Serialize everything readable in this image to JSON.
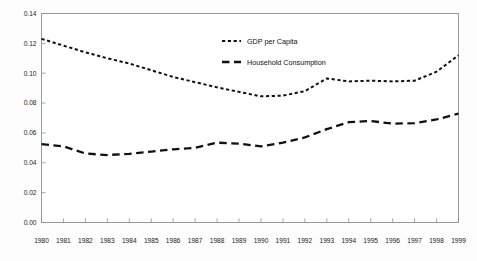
{
  "chart_data": {
    "type": "line",
    "title": "",
    "subtitle": "",
    "xlabel": "",
    "ylabel": "",
    "grid": false,
    "legend_position": "inside-top-center",
    "x": [
      1980,
      1981,
      1982,
      1983,
      1984,
      1985,
      1986,
      1987,
      1988,
      1989,
      1990,
      1991,
      1992,
      1993,
      1994,
      1995,
      1996,
      1997,
      1998,
      1999
    ],
    "categories": [
      "1980",
      "1981",
      "1982",
      "1983",
      "1984",
      "1985",
      "1986",
      "1987",
      "1988",
      "1989",
      "1990",
      "1991",
      "1992",
      "1993",
      "1994",
      "1995",
      "1996",
      "1997",
      "1998",
      "1999"
    ],
    "xlim": [
      1980,
      1999
    ],
    "ylim": [
      0.0,
      0.14
    ],
    "ytick_labels": [
      "0.14",
      "0.12",
      "0.10",
      "0.08",
      "0.06",
      "0.04",
      "0.02",
      "0.00"
    ],
    "ytick_values": [
      0.14,
      0.12,
      0.1,
      0.08,
      0.06,
      0.04,
      0.02,
      0.0
    ],
    "series": [
      {
        "name": "GDP per Capita",
        "style": "dotted",
        "color": "#111111",
        "values": [
          0.123,
          0.1185,
          0.114,
          0.11,
          0.1065,
          0.102,
          0.0975,
          0.094,
          0.0905,
          0.0875,
          0.0845,
          0.085,
          0.088,
          0.0965,
          0.0945,
          0.095,
          0.0945,
          0.095,
          0.101,
          0.112
        ]
      },
      {
        "name": "Household  Consumption",
        "style": "dashed",
        "color": "#111111",
        "values": [
          0.0525,
          0.051,
          0.0462,
          0.0452,
          0.046,
          0.0475,
          0.049,
          0.05,
          0.0535,
          0.0528,
          0.051,
          0.0535,
          0.057,
          0.0625,
          0.0672,
          0.068,
          0.0662,
          0.0665,
          0.069,
          0.073
        ]
      }
    ]
  },
  "legend": {
    "entries": [
      {
        "label": "GDP per Capita",
        "marker": "dotted-line-swatch"
      },
      {
        "label": "Household  Consumption",
        "marker": "dashed-line-swatch"
      }
    ]
  }
}
